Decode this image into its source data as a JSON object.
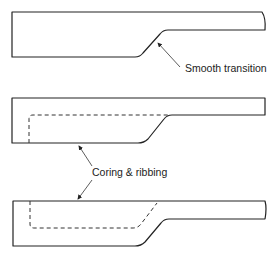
{
  "figure": {
    "panels": [
      {
        "id": "panel-1",
        "description": "Section with smooth transition between thick and thin wall",
        "label": "Smooth transition"
      },
      {
        "id": "panel-2",
        "description": "Same section cored out (dashed inner outline) from the top surface"
      },
      {
        "id": "panel-3",
        "description": "Same section cored out (dashed inner outline) from the bottom surface"
      }
    ],
    "shared_label": "Coring & ribbing",
    "colors": {
      "line": "#222222",
      "background": "#ffffff"
    }
  }
}
